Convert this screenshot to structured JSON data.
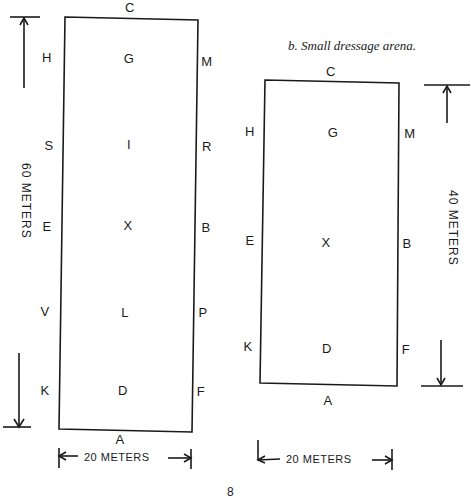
{
  "caption": "b.  Small dressage arena.",
  "page_number": "8",
  "large_arena": {
    "width_label": "20 METERS",
    "length_label": "60 METERS",
    "letters": {
      "top": "C",
      "bottom": "A",
      "left": [
        "H",
        "S",
        "E",
        "V",
        "K"
      ],
      "center": [
        "G",
        "I",
        "X",
        "L",
        "D"
      ],
      "right": [
        "M",
        "R",
        "B",
        "P",
        "F"
      ]
    }
  },
  "small_arena": {
    "width_label": "20 METERS",
    "length_label": "40 METERS",
    "letters": {
      "top": "C",
      "bottom": "A",
      "left": [
        "H",
        "E",
        "K"
      ],
      "center": [
        "G",
        "X",
        "D"
      ],
      "right": [
        "M",
        "B",
        "F"
      ]
    }
  }
}
